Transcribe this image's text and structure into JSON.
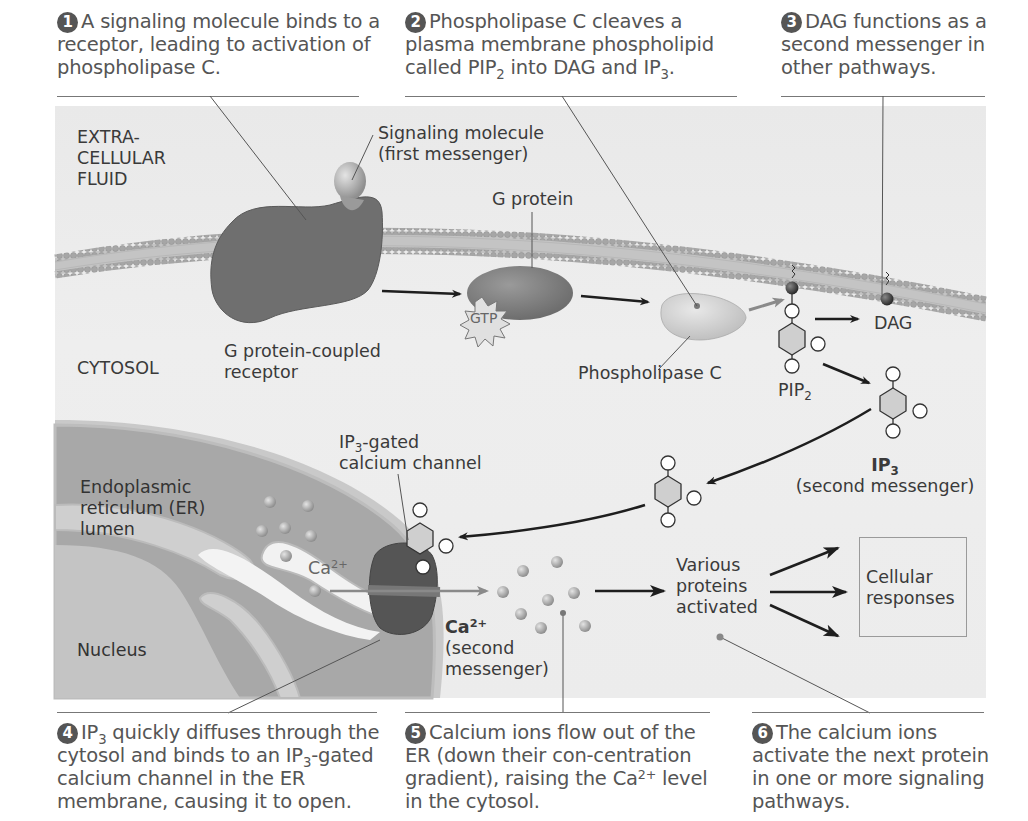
{
  "steps": [
    {
      "num": "1",
      "text": "A signaling molecule binds to a receptor, leading to activation of phospholipase C."
    },
    {
      "num": "2",
      "text_pre": "Phospholipase C cleaves a plasma membrane phospholipid called PIP",
      "sub1": "2",
      "text_mid": " into DAG and IP",
      "sub2": "3",
      "text_post": "."
    },
    {
      "num": "3",
      "text": "DAG functions as a second messenger in other pathways."
    },
    {
      "num": "4",
      "text_a": "IP",
      "sub1": "3",
      "text_b": " quickly diffuses through the cytosol and binds to an IP",
      "sub2": "3",
      "text_c": "-gated calcium channel in the ER membrane, causing it to open."
    },
    {
      "num": "5",
      "text_a": "Calcium ions flow out of the ER (down their con-centration gradient), raising the Ca",
      "sup": "2+",
      "text_b": " level in the cytosol."
    },
    {
      "num": "6",
      "text": "The calcium ions activate the next protein in one or more signaling pathways."
    }
  ],
  "labels": {
    "extracellular_fluid": [
      "EXTRA-",
      "CELLULAR",
      "FLUID"
    ],
    "cytosol": "CYTOSOL",
    "signaling_molecule": [
      "Signaling molecule",
      "(first messenger)"
    ],
    "g_protein": "G protein",
    "gtp": "GTP",
    "gpcr": [
      "G protein-coupled",
      "receptor"
    ],
    "phospholipase_c": "Phospholipase C",
    "dag": "DAG",
    "pip2": {
      "base": "PIP",
      "sub": "2"
    },
    "ip3": {
      "base": "IP",
      "sub": "3",
      "note": "(second messenger)"
    },
    "ip3_gated_channel": {
      "base": "IP",
      "sub": "3",
      "rest": "-gated",
      "line2": "calcium channel"
    },
    "er_lumen": [
      "Endoplasmic",
      "reticulum (ER)",
      "lumen"
    ],
    "nucleus": "Nucleus",
    "ca_er": {
      "base": "Ca",
      "sup": "2+"
    },
    "ca_cytosol": {
      "base": "Ca",
      "sup": "2+",
      "line2": "(second",
      "line3": "messenger)"
    },
    "various_proteins": [
      "Various",
      "proteins",
      "activated"
    ],
    "cellular_responses": [
      "Cellular",
      "responses"
    ]
  },
  "colors": {
    "panel_bg": "#ececec",
    "receptor": "#6e6e6e",
    "membrane": "#b4b4b4",
    "er": "#a9a9a9",
    "nucleus": "#c8c8c8",
    "caption_text": "#555555"
  }
}
